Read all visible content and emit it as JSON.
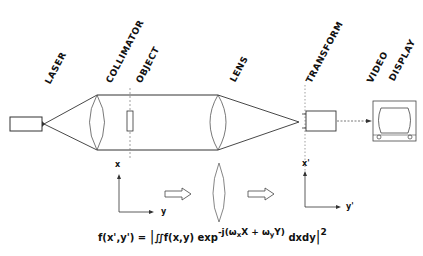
{
  "labels": {
    "laser": "LASER",
    "collimator": "COLLIMATOR",
    "object": "OBJECT",
    "lens": "LENS",
    "transform": "TRANSFORM",
    "video": "VIDEO",
    "display": "DISPLAY"
  },
  "axes": {
    "input_x": "x",
    "input_y": "y",
    "output_x": "x'",
    "output_y": "y'"
  },
  "formula": {
    "lhs": "f(x',y') = ",
    "abs_open": "|",
    "integral": "∬f(x,y) exp",
    "exponent_prefix": "-j(ω",
    "sub_x": "x",
    "exponent_mid1": "X + ω",
    "sub_y": "y",
    "exponent_mid2": "Y)",
    "differential": " dxdy",
    "abs_close": "|",
    "power": "2"
  },
  "colors": {
    "line": "#333333",
    "dashed": "#666666",
    "background": "#ffffff"
  }
}
